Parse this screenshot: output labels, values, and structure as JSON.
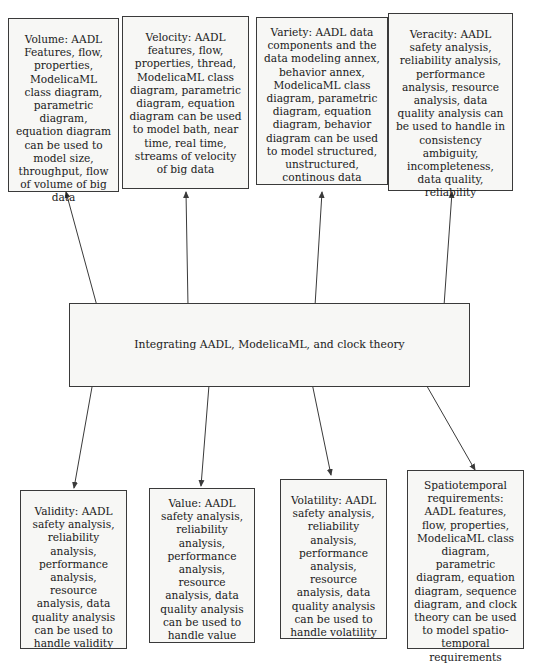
{
  "diagram": {
    "center": {
      "label": "Integrating AADL, ModelicaML, and clock theory"
    },
    "top_boxes": [
      {
        "label": "Volume: AADL Features, flow, properties, ModelicaML class diagram, parametric diagram, equation diagram can be used to model size, throughput, flow of volume of big data"
      },
      {
        "label": "Velocity: AADL features, flow, properties, thread, ModelicaML class diagram, parametric diagram, equation diagram can be used to model bath, near time, real time, streams of velocity of big data"
      },
      {
        "label": "Variety: AADL data components and the data modeling annex, behavior annex, ModelicaML class diagram, parametric diagram, equation diagram, behavior diagram can be used to model structured, unstructured, continous data"
      },
      {
        "label": "Veracity: AADL safety analysis, reliability analysis, performance analysis, resource analysis, data quality analysis can be used to handle in consistency ambiguity, incompleteness, data quality, reliability"
      }
    ],
    "bottom_boxes": [
      {
        "label": "Validity: AADL safety analysis, reliability analysis, performance analysis, resource analysis, data quality analysis can be used to handle validity"
      },
      {
        "label": "Value: AADL safety analysis, reliability analysis, performance analysis, resource analysis, data quality analysis can be used to handle value"
      },
      {
        "label": "Volatility: AADL safety analysis, reliability analysis, performance analysis, resource analysis, data quality analysis can be used to handle volatility"
      },
      {
        "label": "Spatiotemporal requirements: AADL features, flow, properties, ModelicaML class diagram, parametric diagram, equation diagram, sequence diagram, and clock theory can be used to model spatio-temporal requirements"
      }
    ],
    "colors": {
      "line": "#3a3a3a",
      "box_fill": "#f7f7f5"
    }
  }
}
